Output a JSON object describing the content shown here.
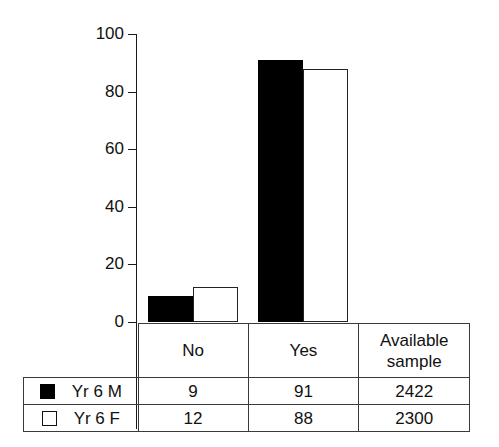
{
  "chart_data": {
    "type": "bar",
    "title": "",
    "subtitle": "",
    "xlabel": "",
    "ylabel": "",
    "categories": [
      "No",
      "Yes"
    ],
    "series": [
      {
        "name": "Yr 6 M",
        "values": [
          9,
          91
        ],
        "swatch": "filled",
        "color": "#000000",
        "available_sample": 2422
      },
      {
        "name": "Yr 6 F",
        "values": [
          12,
          88
        ],
        "swatch": "hollow",
        "color": "#ffffff",
        "available_sample": 2300
      }
    ],
    "ylim": [
      0,
      100
    ],
    "yticks": [
      0,
      20,
      40,
      60,
      80,
      100
    ],
    "ytick_labels": [
      "0",
      "20",
      "40",
      "60",
      "80",
      "100"
    ],
    "grid": false,
    "legend_position": "table-below"
  },
  "table": {
    "headers": [
      "",
      "No",
      "Yes",
      "Available sample"
    ],
    "available_head_line1": "Available",
    "available_head_line2": "sample",
    "rows": [
      {
        "label": "Yr 6 M",
        "swatch": "filled",
        "no": "9",
        "yes": "91",
        "available": "2422"
      },
      {
        "label": "Yr 6 F",
        "swatch": "hollow",
        "no": "12",
        "yes": "88",
        "available": "2300"
      }
    ]
  },
  "axis": {
    "tick_100": "100",
    "tick_80": "80",
    "tick_60": "60",
    "tick_40": "40",
    "tick_20": "20",
    "tick_0": "0"
  },
  "colors": {
    "series_m": "#000000",
    "series_f": "#ffffff",
    "axis": "#1a1a1a",
    "table_border": "#3a3a3a",
    "background": "#ffffff"
  }
}
